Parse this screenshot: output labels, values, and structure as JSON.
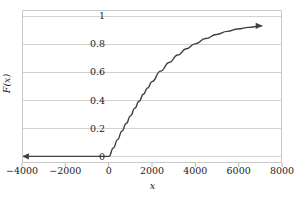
{
  "chart_data": {
    "type": "line",
    "title": "",
    "xlabel": "x",
    "ylabel": "F(x)",
    "xlim": [
      -4000,
      8000
    ],
    "ylim": [
      -0.04,
      1.04
    ],
    "xticks": [
      -4000,
      -2000,
      0,
      2000,
      4000,
      6000,
      8000
    ],
    "xtick_labels": [
      "−4000",
      "−2000",
      "0",
      "2000",
      "4000",
      "6000",
      "8000"
    ],
    "yticks": [
      0,
      0.2,
      0.4,
      0.6,
      0.8,
      1
    ],
    "ytick_labels": [
      "0",
      "0.2",
      "0.4",
      "0.6",
      "0.8",
      "1"
    ],
    "grid": "horizontal",
    "grid_color": "#d0d0d0",
    "frame_color": "#c9c9c9",
    "legend": "none",
    "series": [
      {
        "name": "F(x)",
        "color": "#404040",
        "line_width": 1.4,
        "start_arrow": true,
        "end_arrow": true,
        "description": "Cumulative distribution function: zero for x below 0, then rising concavely toward 1",
        "x": [
          -4000,
          -3000,
          -2000,
          -1000,
          -200,
          0,
          200,
          400,
          600,
          800,
          1000,
          1200,
          1400,
          1600,
          1800,
          2000,
          2400,
          2800,
          3200,
          3600,
          4000,
          4500,
          5000,
          5500,
          6000,
          6500,
          7000,
          7100
        ],
        "y": [
          0,
          0,
          0,
          0,
          0,
          0,
          0.06,
          0.12,
          0.18,
          0.235,
          0.29,
          0.345,
          0.395,
          0.445,
          0.49,
          0.535,
          0.61,
          0.672,
          0.725,
          0.77,
          0.805,
          0.843,
          0.872,
          0.894,
          0.911,
          0.923,
          0.932,
          0.934
        ]
      }
    ],
    "annotations": [
      {
        "name": "left-arrowhead",
        "x": -4000,
        "y": 0,
        "direction": "left"
      },
      {
        "name": "right-arrowhead",
        "x": 7100,
        "y": 0.934,
        "direction": "right"
      }
    ]
  }
}
